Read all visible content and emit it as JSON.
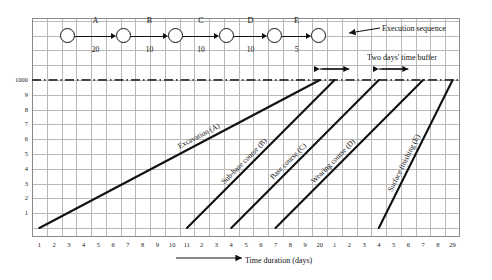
{
  "figure": {
    "title_hidden": "",
    "xaxis_title": "Time duration (days)",
    "annotation_execution_sequence": "Execution sequence",
    "annotation_time_buffer": "Two days' time buffer"
  },
  "network": {
    "node_count": 6,
    "activities": [
      {
        "id": "A",
        "label": "A",
        "duration": "20"
      },
      {
        "id": "B",
        "label": "B",
        "duration": "10"
      },
      {
        "id": "C",
        "label": "C",
        "duration": "10"
      },
      {
        "id": "D",
        "label": "D",
        "duration": "10"
      },
      {
        "id": "E",
        "label": "E",
        "duration": "5"
      }
    ]
  },
  "chart_data": {
    "type": "line",
    "title": "",
    "xlabel": "Time duration (days)",
    "ylabel": "",
    "grid": true,
    "legend": "none",
    "xlim": [
      0,
      29
    ],
    "ylim": [
      0,
      1000
    ],
    "x_tick_labels": [
      "1",
      "2",
      "3",
      "4",
      "5",
      "6",
      "7",
      "8",
      "9",
      "10",
      "11",
      "2",
      "3",
      "4",
      "5",
      "6",
      "7",
      "8",
      "9",
      "20",
      "1",
      "2",
      "3",
      "4",
      "5",
      "6",
      "7",
      "8",
      "29"
    ],
    "y_tick_labels": [
      "1",
      "2",
      "3",
      "4",
      "5",
      "6",
      "7",
      "8",
      "9",
      "1000"
    ],
    "y_tick_values": [
      100,
      200,
      300,
      400,
      500,
      600,
      700,
      800,
      900,
      1000
    ],
    "reference_line": {
      "value": "1000",
      "style": "dash-dot",
      "label": "1000"
    },
    "series": [
      {
        "name": "Excavation (A)",
        "label": "Excavation (A)",
        "start_day": 1,
        "end_day": 20,
        "start_qty": 0,
        "end_qty": 1000
      },
      {
        "name": "Sub-base course (B)",
        "label": "Sub-base course (B)",
        "start_day": 11,
        "end_day": 21,
        "start_qty": 0,
        "end_qty": 1000
      },
      {
        "name": "Base course (C)",
        "label": "Base course (C)",
        "start_day": 14,
        "end_day": 24,
        "start_qty": 0,
        "end_qty": 1000
      },
      {
        "name": "Wearing course (D)",
        "label": "Wearing course (D)",
        "start_day": 17,
        "end_day": 27,
        "start_qty": 0,
        "end_qty": 1000
      },
      {
        "name": "Surface finishing (E)",
        "label": "Surface finishing (E)",
        "start_day": 24,
        "end_day": 29,
        "start_qty": 0,
        "end_qty": 1000
      }
    ],
    "buffers": [
      {
        "label": "Two days' time buffer",
        "from_day": 20,
        "to_day": 22
      },
      {
        "label": "Two days' time buffer",
        "from_day": 24,
        "to_day": 26
      }
    ]
  }
}
